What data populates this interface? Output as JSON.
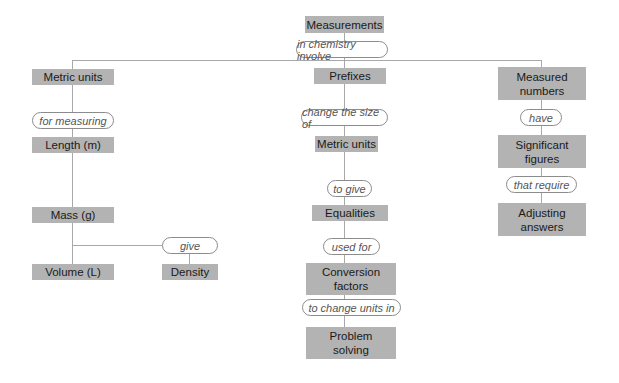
{
  "diagram": {
    "type": "concept-map",
    "colors": {
      "node_fill": "#b3b3b3",
      "connector": "#a9a9a9",
      "link_border": "#8c8c8c",
      "link_text": "#555555"
    },
    "root": {
      "label": "Measurements"
    },
    "root_link": {
      "label": "in chemistry involve"
    },
    "left": {
      "node1": "Metric units",
      "link1": "for measuring",
      "node2": "Length (m)",
      "node3": "Mass (g)",
      "node4": "Volume (L)",
      "link_give": "give",
      "node5": "Density"
    },
    "middle": {
      "node1": "Prefixes",
      "link1": "change the size of",
      "node2": "Metric units",
      "link2": "to give",
      "node3": "Equalities",
      "link3": "used for",
      "node4": "Conversion factors",
      "link4": "to change units in",
      "node5": "Problem solving"
    },
    "right": {
      "node1": "Measured numbers",
      "link1": "have",
      "node2": "Significant figures",
      "link2": "that require",
      "node3": "Adjusting answers"
    }
  }
}
